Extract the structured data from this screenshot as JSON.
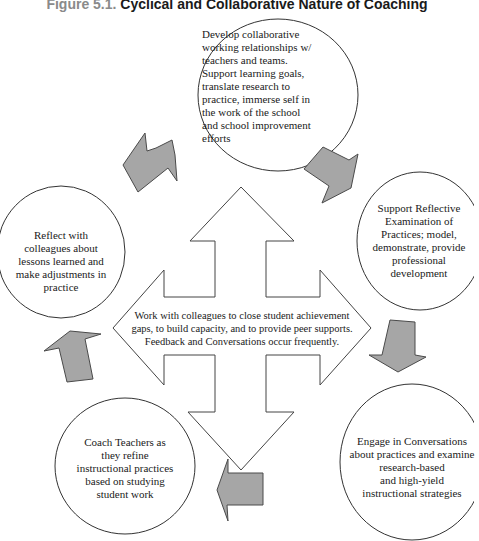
{
  "title": {
    "figure_label": "Figure 5.1.",
    "text": "Cyclical and Collaborative Nature of Coaching"
  },
  "colors": {
    "arrow_fill": "#a6a6a6",
    "arrow_stroke": "#4a4a4a",
    "outline": "#333333",
    "background": "#ffffff",
    "title_label": "#8a8a8a",
    "title_text": "#1a1a1a"
  },
  "center": {
    "lines": [
      "Work with colleagues to close student achievement",
      "gaps, to build capacity, and to provide peer supports.",
      "Feedback and Conversations occur frequently."
    ]
  },
  "circles": [
    {
      "id": "develop",
      "lines": [
        "Develop collaborative",
        "working relationships w/",
        "teachers and teams.",
        "Support learning goals,",
        "translate research to",
        "practice, immerse self in",
        "the work of the school",
        "and school improvement",
        "efforts"
      ]
    },
    {
      "id": "support-reflective",
      "lines": [
        "Support Reflective",
        "Examination of",
        "Practices; model,",
        "demonstrate, provide",
        "professional",
        "development"
      ]
    },
    {
      "id": "engage",
      "lines": [
        "Engage in Conversations",
        "about practices and examine",
        "research-based",
        "and high-yield",
        "instructional strategies"
      ]
    },
    {
      "id": "coach",
      "lines": [
        "Coach Teachers as",
        "they refine",
        "instructional practices",
        "based on studying",
        "student work"
      ]
    },
    {
      "id": "reflect",
      "lines": [
        "Reflect with",
        "colleagues about",
        "lessons learned and",
        "make adjustments in",
        "practice"
      ]
    }
  ]
}
